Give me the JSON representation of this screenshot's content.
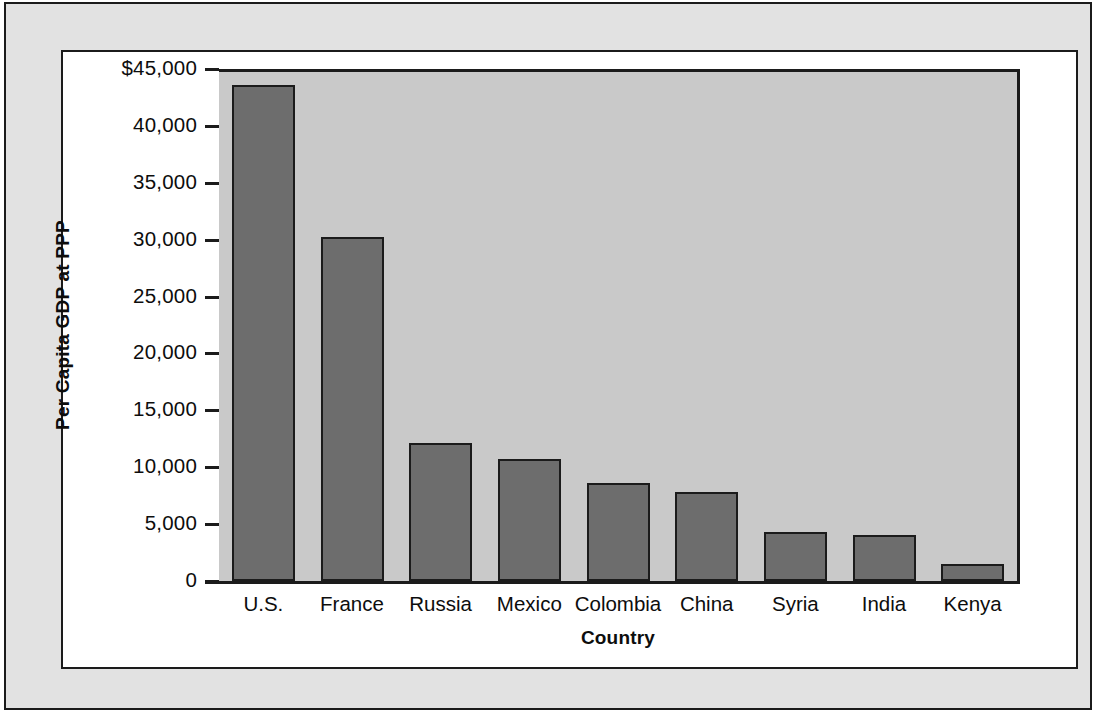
{
  "chart_data": {
    "type": "bar",
    "title": "",
    "xlabel": "Country",
    "ylabel": "Per Capita GDP at PPP",
    "categories": [
      "U.S.",
      "France",
      "Russia",
      "Mexico",
      "Colombia",
      "China",
      "Syria",
      "India",
      "Kenya"
    ],
    "values": [
      43600,
      30200,
      12100,
      10700,
      8600,
      7800,
      4300,
      4000,
      1500
    ],
    "ylim": [
      0,
      45000
    ],
    "ytick_values": [
      0,
      5000,
      10000,
      15000,
      20000,
      25000,
      30000,
      35000,
      40000,
      45000
    ],
    "ytick_labels": [
      "0",
      "5,000",
      "10,000",
      "15,000",
      "20,000",
      "25,000",
      "30,000",
      "35,000",
      "40,000",
      "$45,000"
    ],
    "grid": false,
    "legend": false,
    "legend_position": "none",
    "bar_color": "#6d6d6d",
    "bar_edge_color": "#1b1b1b",
    "plot_background_color": "#c9c9c9",
    "page_background_color": "#e2e2e2",
    "panel_background_color": "#ffffff",
    "axis_color": "#1b1b1b",
    "text_color": "#0d0d0d"
  }
}
